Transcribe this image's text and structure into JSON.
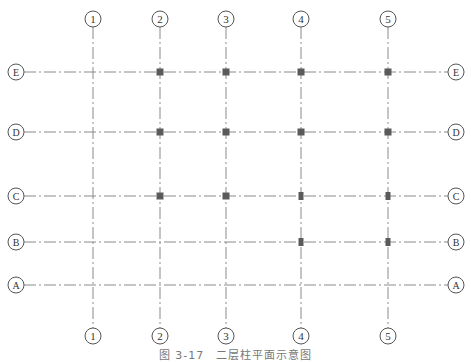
{
  "figure": {
    "caption": "图 3-17　二层柱平面示意图",
    "colors": {
      "axis_line": "#8a8a8a",
      "bubble": "#555555",
      "column": "#5a5a5a",
      "text": "#333333"
    }
  },
  "axes_vertical": [
    {
      "label": "1",
      "x": 93
    },
    {
      "label": "2",
      "x": 160
    },
    {
      "label": "3",
      "x": 226
    },
    {
      "label": "4",
      "x": 301
    },
    {
      "label": "5",
      "x": 388
    }
  ],
  "axes_horizontal": [
    {
      "label": "E",
      "y": 72
    },
    {
      "label": "D",
      "y": 132
    },
    {
      "label": "C",
      "y": 196
    },
    {
      "label": "B",
      "y": 242
    },
    {
      "label": "A",
      "y": 285
    }
  ],
  "columns": [
    {
      "axis_x": "2",
      "axis_y": "E"
    },
    {
      "axis_x": "3",
      "axis_y": "E"
    },
    {
      "axis_x": "4",
      "axis_y": "E"
    },
    {
      "axis_x": "5",
      "axis_y": "E"
    },
    {
      "axis_x": "2",
      "axis_y": "D"
    },
    {
      "axis_x": "3",
      "axis_y": "D"
    },
    {
      "axis_x": "4",
      "axis_y": "D"
    },
    {
      "axis_x": "5",
      "axis_y": "D"
    },
    {
      "axis_x": "2",
      "axis_y": "C"
    },
    {
      "axis_x": "3",
      "axis_y": "C"
    },
    {
      "axis_x": "4",
      "axis_y": "C"
    },
    {
      "axis_x": "5",
      "axis_y": "C"
    },
    {
      "axis_x": "4",
      "axis_y": "B"
    },
    {
      "axis_x": "5",
      "axis_y": "B"
    }
  ]
}
